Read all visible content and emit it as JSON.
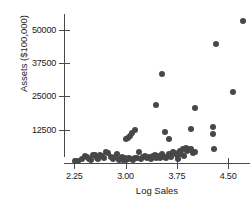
{
  "chart_data": {
    "type": "scatter",
    "title": "",
    "xlabel": "Log Sales",
    "ylabel": "Assets ($100,000)",
    "xlim": [
      2.1,
      4.82
    ],
    "ylim": [
      0,
      56000
    ],
    "grid": false,
    "legend": null,
    "xticks": [
      2.25,
      3.0,
      3.75,
      4.5
    ],
    "xtick_labels": [
      "2.25",
      "3.00",
      "3.75",
      "4.50"
    ],
    "yticks": [
      12500,
      25000,
      37500,
      50000
    ],
    "ytick_labels": [
      "12500",
      "25000",
      "37500",
      "50000"
    ],
    "marker": {
      "shape": "circle",
      "color": "#474747",
      "size_px": 6
    },
    "points": [
      {
        "x": 2.26,
        "y": 800
      },
      {
        "x": 2.3,
        "y": 900
      },
      {
        "x": 2.36,
        "y": 1500
      },
      {
        "x": 2.4,
        "y": 2500
      },
      {
        "x": 2.43,
        "y": 2300
      },
      {
        "x": 2.46,
        "y": 1400
      },
      {
        "x": 2.49,
        "y": 1100
      },
      {
        "x": 2.52,
        "y": 2900
      },
      {
        "x": 2.55,
        "y": 3000
      },
      {
        "x": 2.58,
        "y": 2000
      },
      {
        "x": 2.6,
        "y": 1600
      },
      {
        "x": 2.63,
        "y": 3100
      },
      {
        "x": 2.66,
        "y": 2600
      },
      {
        "x": 2.69,
        "y": 1700
      },
      {
        "x": 2.72,
        "y": 4100
      },
      {
        "x": 2.75,
        "y": 3900
      },
      {
        "x": 2.78,
        "y": 2400
      },
      {
        "x": 2.82,
        "y": 1600
      },
      {
        "x": 2.85,
        "y": 2200
      },
      {
        "x": 2.88,
        "y": 3300
      },
      {
        "x": 2.9,
        "y": 1300
      },
      {
        "x": 2.92,
        "y": 1500
      },
      {
        "x": 2.95,
        "y": 2100
      },
      {
        "x": 2.97,
        "y": 1200
      },
      {
        "x": 2.99,
        "y": 1800
      },
      {
        "x": 3.01,
        "y": 9000
      },
      {
        "x": 3.04,
        "y": 9400
      },
      {
        "x": 3.07,
        "y": 10000
      },
      {
        "x": 3.1,
        "y": 11200
      },
      {
        "x": 3.14,
        "y": 12300
      },
      {
        "x": 3.0,
        "y": 1000
      },
      {
        "x": 3.02,
        "y": 1400
      },
      {
        "x": 3.05,
        "y": 1900
      },
      {
        "x": 3.08,
        "y": 1500
      },
      {
        "x": 3.11,
        "y": 1100
      },
      {
        "x": 3.14,
        "y": 2000
      },
      {
        "x": 3.17,
        "y": 1700
      },
      {
        "x": 3.2,
        "y": 4200
      },
      {
        "x": 3.22,
        "y": 1600
      },
      {
        "x": 3.25,
        "y": 2100
      },
      {
        "x": 3.28,
        "y": 2500
      },
      {
        "x": 3.31,
        "y": 1800
      },
      {
        "x": 3.34,
        "y": 2300
      },
      {
        "x": 3.37,
        "y": 1500
      },
      {
        "x": 3.4,
        "y": 2700
      },
      {
        "x": 3.43,
        "y": 3000
      },
      {
        "x": 3.45,
        "y": 2000
      },
      {
        "x": 3.48,
        "y": 2600
      },
      {
        "x": 3.51,
        "y": 1900
      },
      {
        "x": 3.54,
        "y": 3200
      },
      {
        "x": 3.56,
        "y": 2400
      },
      {
        "x": 3.59,
        "y": 1700
      },
      {
        "x": 3.62,
        "y": 2800
      },
      {
        "x": 3.64,
        "y": 3400
      },
      {
        "x": 3.67,
        "y": 2200
      },
      {
        "x": 3.7,
        "y": 4000
      },
      {
        "x": 3.72,
        "y": 3700
      },
      {
        "x": 3.75,
        "y": 2900
      },
      {
        "x": 3.77,
        "y": 1400
      },
      {
        "x": 3.79,
        "y": 4600
      },
      {
        "x": 3.81,
        "y": 3300
      },
      {
        "x": 3.84,
        "y": 5300
      },
      {
        "x": 3.86,
        "y": 2500
      },
      {
        "x": 3.88,
        "y": 5600
      },
      {
        "x": 3.9,
        "y": 4400
      },
      {
        "x": 3.92,
        "y": 5100
      },
      {
        "x": 3.94,
        "y": 4900
      },
      {
        "x": 3.96,
        "y": 5400
      },
      {
        "x": 3.99,
        "y": 3600
      },
      {
        "x": 4.01,
        "y": 4200
      },
      {
        "x": 3.58,
        "y": 11600
      },
      {
        "x": 3.63,
        "y": 9100
      },
      {
        "x": 3.95,
        "y": 12900
      },
      {
        "x": 4.02,
        "y": 20800
      },
      {
        "x": 3.44,
        "y": 21900
      },
      {
        "x": 3.53,
        "y": 33400
      },
      {
        "x": 4.28,
        "y": 13600
      },
      {
        "x": 4.28,
        "y": 11000
      },
      {
        "x": 4.3,
        "y": 5400
      },
      {
        "x": 4.33,
        "y": 44900
      },
      {
        "x": 4.57,
        "y": 26500
      },
      {
        "x": 4.72,
        "y": 53400
      }
    ]
  },
  "axes": {
    "x_title": "Log Sales",
    "y_title": "Assets ($100,000)"
  }
}
